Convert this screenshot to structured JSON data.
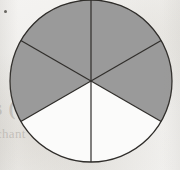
{
  "figure": {
    "name": "fraction-circle-sixths",
    "total_sectors": 6,
    "shaded_sectors": 4,
    "unshaded_sectors": 2,
    "fraction_label": "4/6",
    "geometry": {
      "center_x": 91,
      "center_y": 81,
      "radius": 81,
      "sector_angle_degrees": 60,
      "start_angle_degrees": -90
    },
    "colors": {
      "shaded_fill": "#9a9a9a",
      "unshaded_fill": "#fbfbfa",
      "outline": "#2f2d2a",
      "paper_background": "#f1f0ee",
      "bleed_text": "#78726a"
    },
    "sectors": [
      {
        "index": 0,
        "name": "sector-top-right",
        "from_degrees": -90,
        "to_degrees": -30,
        "shaded": true,
        "fill": "#9a9a9a"
      },
      {
        "index": 1,
        "name": "sector-right",
        "from_degrees": -30,
        "to_degrees": 30,
        "shaded": true,
        "fill": "#9a9a9a"
      },
      {
        "index": 2,
        "name": "sector-bottom-right",
        "from_degrees": 30,
        "to_degrees": 90,
        "shaded": false,
        "fill": "#fbfbfa"
      },
      {
        "index": 3,
        "name": "sector-bottom-left",
        "from_degrees": 90,
        "to_degrees": 150,
        "shaded": false,
        "fill": "#fbfbfa"
      },
      {
        "index": 4,
        "name": "sector-left",
        "from_degrees": 150,
        "to_degrees": 210,
        "shaded": true,
        "fill": "#9a9a9a"
      },
      {
        "index": 5,
        "name": "sector-top-left",
        "from_degrees": 210,
        "to_degrees": 270,
        "shaded": true,
        "fill": "#9a9a9a"
      }
    ],
    "dividers": [
      {
        "name": "divider-vertical",
        "angle_degrees": 90
      },
      {
        "name": "divider-upper-right",
        "angle_degrees": 30
      },
      {
        "name": "divider-upper-left",
        "angle_degrees": 150
      }
    ]
  },
  "artifacts": {
    "ink_speck": "ink-speck",
    "bleed_through_line_1": "s (OUFT)",
    "bleed_through_line_2": "chant what doma"
  }
}
